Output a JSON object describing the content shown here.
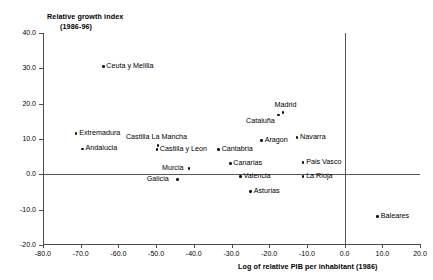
{
  "chart_data": {
    "type": "scatter",
    "title": "",
    "ylabel_line1": "Relative growth index",
    "ylabel_line2": "(1986-96)",
    "xlabel": "Log of relative PIB per inhabitant (1986)",
    "xlim": [
      -80.0,
      20.0
    ],
    "ylim": [
      -20.0,
      40.0
    ],
    "xticks": [
      "-80.0",
      "-70.0",
      "-60.0",
      "-50.0",
      "-40.0",
      "-30.0",
      "-20.0",
      "-10.0",
      "0.0",
      "10.0",
      "20.0"
    ],
    "xtick_values": [
      -80,
      -70,
      -60,
      -50,
      -40,
      -30,
      -20,
      -10,
      0,
      10,
      20
    ],
    "yticks": [
      "40.0",
      "30.0",
      "20.0",
      "10.0",
      "0.0",
      "-10.0",
      "-20.0"
    ],
    "ytick_values": [
      40,
      30,
      20,
      10,
      0,
      -10,
      -20
    ],
    "grid": false,
    "legend": "none",
    "reference_lines": [
      {
        "axis": "horizontal",
        "value": 0.0
      },
      {
        "axis": "vertical",
        "value": 0.0
      }
    ],
    "points": [
      {
        "label": "Ceuta y Melilla",
        "x": -64.0,
        "y": 30.5,
        "label_pos": "right"
      },
      {
        "label": "Extremadura",
        "x": -71.2,
        "y": 11.5,
        "label_pos": "right"
      },
      {
        "label": "Andalucia",
        "x": -69.5,
        "y": 7.2,
        "label_pos": "right"
      },
      {
        "label": "Castilla La Mancha",
        "x": -49.5,
        "y": 8.2,
        "label_pos": "above"
      },
      {
        "label": "Castilla y Leon",
        "x": -49.8,
        "y": 7.0,
        "label_pos": "right"
      },
      {
        "label": "Murcia",
        "x": -41.3,
        "y": 1.6,
        "label_pos": "left"
      },
      {
        "label": "Galicia",
        "x": -44.3,
        "y": -1.5,
        "label_pos": "left"
      },
      {
        "label": "Cantabria",
        "x": -33.4,
        "y": 7.0,
        "label_pos": "right"
      },
      {
        "label": "Canarias",
        "x": -30.3,
        "y": 3.0,
        "label_pos": "right"
      },
      {
        "label": "Valencia",
        "x": -27.6,
        "y": -0.6,
        "label_pos": "right"
      },
      {
        "label": "Asturias",
        "x": -24.9,
        "y": -4.8,
        "label_pos": "right"
      },
      {
        "label": "Aragon",
        "x": -22.0,
        "y": 9.6,
        "label_pos": "right"
      },
      {
        "label": "Cataluña",
        "x": -17.6,
        "y": 16.8,
        "label_pos": "below-left"
      },
      {
        "label": "Madrid",
        "x": -16.3,
        "y": 17.5,
        "label_pos": "above"
      },
      {
        "label": "Navarra",
        "x": -12.6,
        "y": 10.4,
        "label_pos": "right"
      },
      {
        "label": "Pais Vasco",
        "x": -11.0,
        "y": 3.4,
        "label_pos": "right"
      },
      {
        "label": "La Rioja",
        "x": -11.0,
        "y": -0.6,
        "label_pos": "right"
      },
      {
        "label": "Baleares",
        "x": 8.8,
        "y": -12.0,
        "label_pos": "right"
      }
    ]
  }
}
